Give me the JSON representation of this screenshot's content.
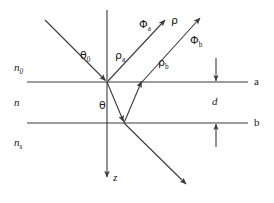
{
  "figure": {
    "kind": "optics-ray-diagram",
    "background_color": "#ffffff",
    "line_color": "#3a3a3a",
    "text_color": "#1a1a1a",
    "width": 274,
    "height": 203
  },
  "media": {
    "incident": {
      "symbol": "n",
      "subscript": "0",
      "description": "ambient medium above interface a"
    },
    "film": {
      "symbol": "n",
      "subscript": "",
      "description": "thin film of thickness d between a and b"
    },
    "substrate": {
      "symbol": "n",
      "subscript": "s",
      "description": "substrate below interface b"
    }
  },
  "interfaces": [
    {
      "label": "a",
      "y": 82,
      "x_start": 27,
      "x_end": 248
    },
    {
      "label": "b",
      "y": 123,
      "x_start": 27,
      "x_end": 248
    }
  ],
  "thickness": {
    "label": "d",
    "between": [
      "a",
      "b"
    ]
  },
  "axis": {
    "label": "z",
    "direction": "down",
    "x": 107,
    "y_start": 10,
    "y_end": 178
  },
  "angles": [
    {
      "label": "θ0",
      "glyph": "θ",
      "subscript": "0",
      "at": "interface-a",
      "meaning": "angle of incidence"
    },
    {
      "label": "θ",
      "glyph": "θ",
      "subscript": "",
      "at": "inside-film",
      "meaning": "refraction angle in film"
    }
  ],
  "rays": [
    {
      "name": "incident",
      "label": "",
      "from": [
        45,
        20
      ],
      "to": [
        107,
        82
      ],
      "arrow": "end"
    },
    {
      "name": "reflected-a",
      "label": "ρa",
      "glyph": "ρ",
      "subscript": "a",
      "from": [
        107,
        82
      ],
      "to": [
        165,
        20
      ],
      "arrow": "end"
    },
    {
      "name": "refracted-film",
      "label": "",
      "from": [
        107,
        82
      ],
      "to": [
        124,
        123
      ],
      "arrow": "end"
    },
    {
      "name": "internal-reflect",
      "label": "",
      "from": [
        124,
        123
      ],
      "to": [
        142,
        82
      ],
      "arrow": "end"
    },
    {
      "name": "reflected-b",
      "label": "ρb",
      "glyph": "ρ",
      "subscript": "b",
      "from": [
        142,
        82
      ],
      "to": [
        200,
        18
      ],
      "arrow": "end"
    },
    {
      "name": "transmitted",
      "label": "",
      "from": [
        124,
        123
      ],
      "to": [
        186,
        185
      ],
      "arrow": "end"
    }
  ],
  "labels": {
    "rho": {
      "glyph": "ρ",
      "subscript": ""
    },
    "rho_a": {
      "glyph": "ρ",
      "subscript": "a"
    },
    "rho_b": {
      "glyph": "ρ",
      "subscript": "b"
    },
    "phi_a": {
      "glyph": "Φ",
      "subscript": "a"
    },
    "phi_b": {
      "glyph": "Φ",
      "subscript": "b"
    },
    "theta_0": {
      "glyph": "θ",
      "subscript": "0"
    },
    "theta": {
      "glyph": "θ",
      "subscript": ""
    },
    "n_0": {
      "glyph": "n",
      "subscript": "0"
    },
    "n": {
      "glyph": "n",
      "subscript": ""
    },
    "n_s": {
      "glyph": "n",
      "subscript": "s"
    },
    "d": {
      "glyph": "d",
      "subscript": ""
    },
    "z": {
      "glyph": "z",
      "subscript": ""
    },
    "a": {
      "glyph": "a",
      "subscript": ""
    },
    "b": {
      "glyph": "b",
      "subscript": ""
    }
  }
}
